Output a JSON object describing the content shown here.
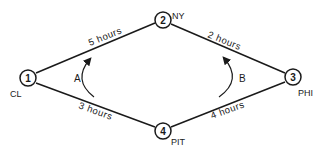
{
  "diagram": {
    "type": "network-graph",
    "colors": {
      "stroke": "#1a1a1a",
      "background": "#ffffff"
    },
    "nodes": [
      {
        "id": "1",
        "label": "1",
        "city": "CL"
      },
      {
        "id": "2",
        "label": "2",
        "city": "NY"
      },
      {
        "id": "3",
        "label": "3",
        "city": "PHI"
      },
      {
        "id": "4",
        "label": "4",
        "city": "PIT"
      }
    ],
    "edges": [
      {
        "from": "1",
        "to": "2",
        "label": "5 hours"
      },
      {
        "from": "2",
        "to": "3",
        "label": "2 hours"
      },
      {
        "from": "1",
        "to": "4",
        "label": "3 hours"
      },
      {
        "from": "4",
        "to": "3",
        "label": "4 hours"
      }
    ],
    "paths": [
      {
        "label": "A",
        "direction": "upward (from edge 1-4 toward edge 1-2)"
      },
      {
        "label": "B",
        "direction": "upward (from edge 4-3 toward edge 2-3)"
      }
    ]
  }
}
